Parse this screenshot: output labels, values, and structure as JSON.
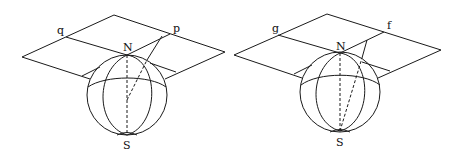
{
  "figure": {
    "left": {
      "labels": {
        "plane_point_1": "q",
        "plane_point_2": "p",
        "north_pole": "N",
        "south_pole": "S"
      }
    },
    "right": {
      "labels": {
        "plane_point_1": "g",
        "plane_point_2": "f",
        "north_pole": "N",
        "south_pole": "S"
      }
    },
    "colors": {
      "line": "#1a1a1a",
      "background": "#ffffff"
    }
  }
}
